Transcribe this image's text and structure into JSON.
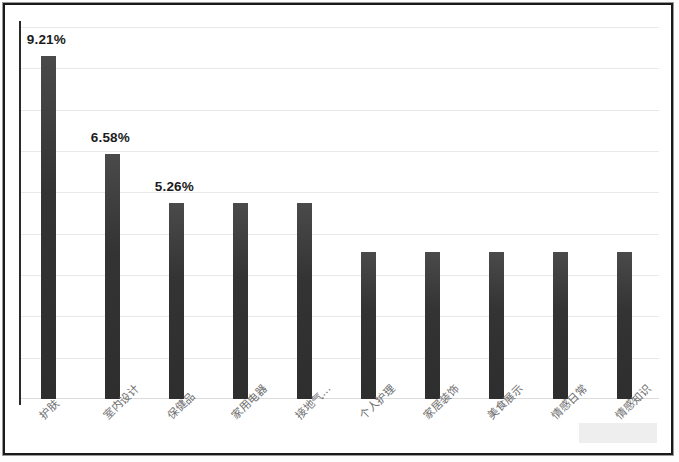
{
  "chart_data": {
    "type": "bar",
    "title": "",
    "subtitle": "",
    "xlabel": "",
    "ylabel": "",
    "categories": [
      "护肤",
      "室内设计",
      "保健品",
      "家用电器",
      "接地气…",
      "个人护理",
      "家居装饰",
      "美食展示",
      "情感日常",
      "情感知识"
    ],
    "values": [
      9.21,
      6.58,
      5.26,
      5.26,
      5.26,
      3.95,
      3.95,
      3.95,
      3.95,
      3.95
    ],
    "value_labels": [
      "9.21%",
      "6.58%",
      "5.26%",
      "",
      "",
      "",
      "",
      "",
      "",
      ""
    ],
    "labeled_points": [
      {
        "category": "护肤",
        "value": 9.21,
        "label": "9.21%"
      },
      {
        "category": "室内设计",
        "value": 6.58,
        "label": "6.58%"
      },
      {
        "category": "保健品",
        "value": 5.26,
        "label": "5.26%"
      }
    ],
    "ylim": [
      0,
      10.0
    ],
    "y_gridline_count": 9,
    "grid": true,
    "legend": null,
    "legend_position": "none",
    "y_tick_labels": [],
    "series": [
      {
        "name": "占比",
        "values": [
          9.21,
          6.58,
          5.26,
          5.26,
          5.26,
          3.95,
          3.95,
          3.95,
          3.95,
          3.95
        ]
      }
    ],
    "bar_color": "#333333",
    "gridline_color": "#e8e8e8",
    "axis_color": "#2a2a2a",
    "label_color": "#1c1c1c",
    "tick_label_color": "#6e6e6e",
    "units": "%"
  }
}
